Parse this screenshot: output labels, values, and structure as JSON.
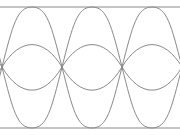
{
  "diagram": {
    "type": "eye-diagram",
    "stroke_color": "#8a8a8a",
    "background": "#ffffff",
    "unit_interval_px": 60,
    "crossings_x": [
      2,
      62,
      122,
      182
    ],
    "levels": {
      "high_y": 7,
      "mid_y": 67,
      "low_y": 128
    },
    "inner_swing": {
      "upper_peak_y": 37,
      "lower_trough_y": 98
    },
    "eyes_visible": 3
  }
}
